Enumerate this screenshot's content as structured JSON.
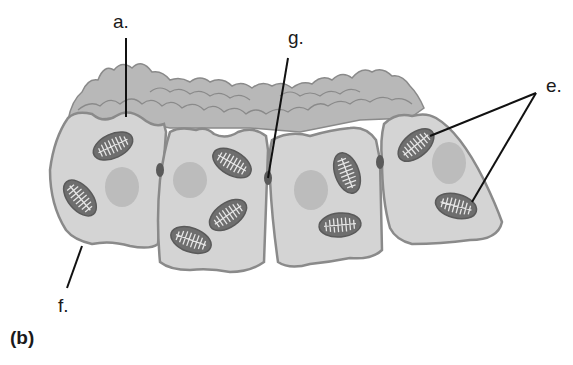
{
  "diagram": {
    "panel_label": "(b)",
    "labels": {
      "a": "a.",
      "e": "e.",
      "f": "f.",
      "g": "g."
    },
    "colors": {
      "cytoplasm": "#d4d4d4",
      "membrane": "#8a8a8a",
      "microvilli": "#b5b5b5",
      "nucleus": "#bcbcbc",
      "mitochondrion": "#6e6e6e",
      "cristae": "#e6e6e6",
      "junction": "#555555",
      "leader_line": "#111111"
    },
    "cells": [
      {
        "id": "cell-1",
        "mitochondria": 2,
        "nucleus": 1
      },
      {
        "id": "cell-2",
        "mitochondria": 3,
        "nucleus": 1
      },
      {
        "id": "cell-3",
        "mitochondria": 2,
        "nucleus": 1
      },
      {
        "id": "cell-4",
        "mitochondria": 2,
        "nucleus": 1
      }
    ]
  }
}
